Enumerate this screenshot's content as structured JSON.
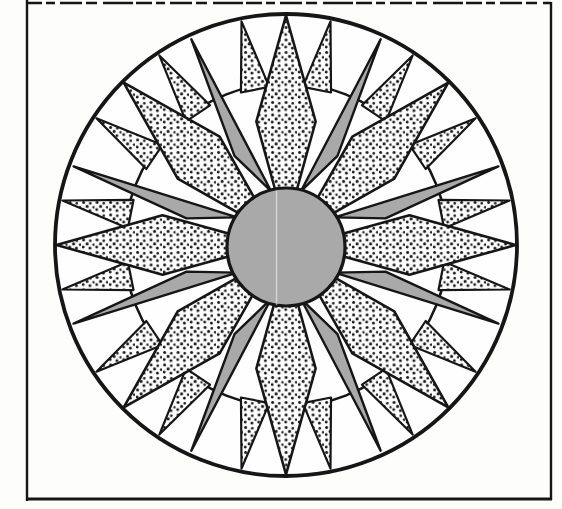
{
  "figure": {
    "canvas": {
      "width": 562,
      "height": 509
    },
    "colors": {
      "background": "#fdfdfc",
      "ink": "#161616",
      "gray_fill": "#a9a9a9",
      "paper_white": "#fefefe"
    },
    "frame": {
      "left": 27,
      "top": 3,
      "right": 551,
      "bottom": 499,
      "stroke_width": 2.4,
      "top_dash": "16 4 9 5 22 4 11 6 30 3"
    },
    "compass": {
      "cx": 286,
      "cy": 245,
      "outer_ring": {
        "r": 231,
        "stroke_width": 3.8
      },
      "mid_ring": {
        "r": 162,
        "stroke_width": 2.6
      },
      "center_circle": {
        "cx": 286,
        "cy": 247,
        "r": 59,
        "stroke_width": 3.2
      },
      "long_points": {
        "count": 8,
        "start_angle": 0,
        "step": 45,
        "tip_r": 229.5,
        "side_r": 127,
        "side_half_angle": 13.5,
        "base_r": 16,
        "stroke_width": 2.6
      },
      "gray_blades": {
        "angles": [
          22.5,
          67.5,
          112.5,
          157.5,
          202.5,
          247.5,
          292.5,
          337.5
        ],
        "lean_signs": [
          1,
          1,
          -1,
          -1,
          1,
          1,
          -1,
          -1
        ],
        "tip_r": 226.5,
        "tip_lean_deg": 2.2,
        "far_r": 103,
        "far_lean_deg": 7.5,
        "near_r": 56,
        "near_lean_deg": 7,
        "stroke_width": 2.4
      },
      "small_points": {
        "count": 16,
        "start_angle": 11.25,
        "step": 22.5,
        "tip_r": 228,
        "base_r": 159,
        "base_half_angle": 5.2,
        "stroke_width": 2.2
      }
    },
    "stipple_pattern": {
      "tile_width": 13.5,
      "tile_height": 12.5,
      "dots": [
        {
          "x": 2.6,
          "y": 2.4,
          "r": 1.5
        },
        {
          "x": 9.3,
          "y": 3.3,
          "r": 1.3
        },
        {
          "x": 6.1,
          "y": 6.4,
          "r": 1.55
        },
        {
          "x": 12.6,
          "y": 7.2,
          "r": 1.3
        },
        {
          "x": 2.2,
          "y": 9.6,
          "r": 1.4
        },
        {
          "x": 8.9,
          "y": 10.6,
          "r": 1.5
        }
      ]
    },
    "scan_artifact": {
      "x": 276.5,
      "y1": 191,
      "y2": 305,
      "opacity": 0.55,
      "width": 1.3
    }
  }
}
